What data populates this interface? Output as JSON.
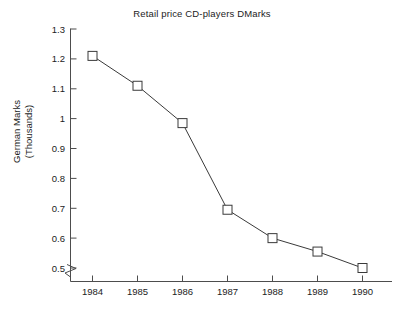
{
  "chart_data": {
    "type": "line",
    "title": "Retail price CD-players DMarks",
    "xlabel": "",
    "ylabel": "German Marks (Thousands)",
    "ylabel_lines": [
      "German Marks",
      "(Thousands)"
    ],
    "categories": [
      "1984",
      "1985",
      "1986",
      "1987",
      "1988",
      "1989",
      "1990"
    ],
    "x": [
      1984,
      1985,
      1986,
      1987,
      1988,
      1989,
      1990
    ],
    "values": [
      1.21,
      1.11,
      0.985,
      0.695,
      0.6,
      0.555,
      0.5
    ],
    "series": [
      {
        "name": "Retail price CD-players",
        "values": [
          1.21,
          1.11,
          0.985,
          0.695,
          0.6,
          0.555,
          0.5
        ]
      }
    ],
    "ylim": [
      0.5,
      1.3
    ],
    "yticks": [
      0.5,
      0.6,
      0.7,
      0.8,
      0.9,
      1.0,
      1.1,
      1.2,
      1.3
    ],
    "ytick_labels": [
      "0.5",
      "0.6",
      "0.7",
      "0.8",
      "0.9",
      "1",
      "1.1",
      "1.2",
      "1.3"
    ],
    "xtick_labels": [
      "1984",
      "1985",
      "1986",
      "1987",
      "1988",
      "1989",
      "1990"
    ],
    "grid": false,
    "legend": false,
    "legend_position": "none",
    "marker": "open-square",
    "axis_break": "y-axis break below 0.5",
    "line_color": "#3a3a3a",
    "marker_color": "#3a3a3a",
    "axis_color": "#4d4d4d",
    "background_color": "#ffffff"
  }
}
